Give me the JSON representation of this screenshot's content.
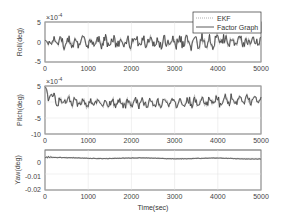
{
  "chart_data": [
    {
      "type": "line",
      "ylabel": "Roll(deg)",
      "exponent_label": "×10⁻⁴",
      "xlim": [
        0,
        5000
      ],
      "ylim": [
        -5,
        5
      ],
      "yticks": [
        "5",
        "0",
        "-5"
      ],
      "xticks": [
        "0",
        "1000",
        "2000",
        "3000",
        "4000",
        "5000"
      ],
      "grid": true,
      "series": [
        {
          "name": "EKF",
          "style": "dotted"
        },
        {
          "name": "Factor Graph",
          "style": "solid"
        }
      ],
      "approx_range": [
        -2.5,
        2.5
      ],
      "mean": 0
    },
    {
      "type": "line",
      "ylabel": "Pitch(deg)",
      "exponent_label": "×10⁻⁴",
      "xlim": [
        0,
        5000
      ],
      "ylim": [
        -10,
        5
      ],
      "yticks": [
        "5",
        "0",
        "-5",
        "-10"
      ],
      "xticks": [
        "0",
        "1000",
        "2000",
        "3000",
        "4000",
        "5000"
      ],
      "grid": true,
      "approx_start": 3,
      "approx_range": [
        -2.5,
        3.5
      ],
      "mean": 0.5
    },
    {
      "type": "line",
      "ylabel": "Yaw(deg)",
      "xlabel": "Time(sec)",
      "xlim": [
        0,
        5000
      ],
      "ylim": [
        -0.02,
        0.005
      ],
      "yticks": [
        "0",
        "-0.01",
        "-0.02"
      ],
      "xticks": [
        "0",
        "1000",
        "2000",
        "3000",
        "4000",
        "5000"
      ],
      "grid": true,
      "approx_start": 0.001,
      "approx_end": -0.001
    }
  ],
  "legend": {
    "items": [
      "EKF",
      "Factor Graph"
    ],
    "position": "upper right"
  },
  "labels": {
    "roll": "Roll(deg)",
    "pitch": "Pitch(deg)",
    "yaw": "Yaw(deg)",
    "time": "Time(sec)",
    "exp": "×10",
    "exp_pow": "-4"
  },
  "ticks": {
    "x": [
      "0",
      "1000",
      "2000",
      "3000",
      "4000",
      "5000"
    ],
    "roll": [
      "5",
      "0",
      "-5"
    ],
    "pitch": [
      "5",
      "0",
      "-5",
      "-10"
    ],
    "yaw": [
      "0",
      "-0.01",
      "-0.02"
    ]
  }
}
